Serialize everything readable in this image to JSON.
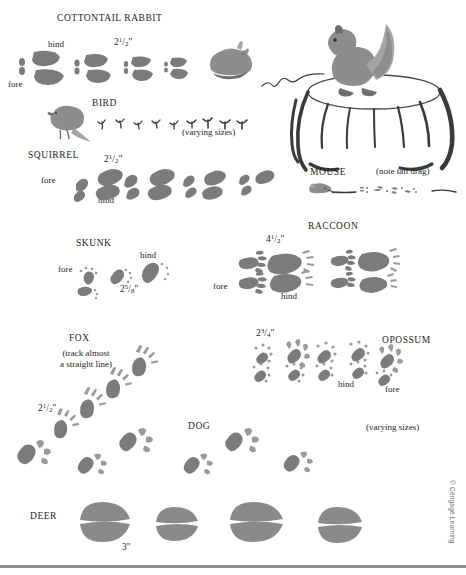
{
  "chart": {
    "credit": "© Cengage Learning"
  },
  "species": [
    {
      "id": "cottontail-rabbit",
      "name": "COTTONTAIL RABBIT",
      "measurement": {
        "whole": "2",
        "num": "1",
        "den": "2",
        "unit": "\""
      },
      "notes": [
        {
          "text": "hind"
        },
        {
          "text": "fore"
        }
      ]
    },
    {
      "id": "bird",
      "name": "BIRD",
      "notes": [
        {
          "text": "(varying sizes)"
        }
      ]
    },
    {
      "id": "squirrel",
      "name": "SQUIRREL",
      "measurement": {
        "whole": "2",
        "num": "1",
        "den": "2",
        "unit": "\""
      },
      "notes": [
        {
          "text": "fore"
        },
        {
          "text": "hind"
        }
      ]
    },
    {
      "id": "mouse",
      "name": "MOUSE",
      "notes": [
        {
          "text": "(note tail drag)"
        }
      ]
    },
    {
      "id": "skunk",
      "name": "SKUNK",
      "measurement": {
        "whole": "2",
        "num": "5",
        "den": "8",
        "unit": "\""
      },
      "notes": [
        {
          "text": "fore"
        },
        {
          "text": "hind"
        }
      ]
    },
    {
      "id": "raccoon",
      "name": "RACCOON",
      "measurement": {
        "whole": "4",
        "num": "1",
        "den": "2",
        "unit": "\""
      },
      "notes": [
        {
          "text": "fore"
        },
        {
          "text": "hind"
        }
      ]
    },
    {
      "id": "fox",
      "name": "FOX",
      "measurement": {
        "whole": "2",
        "num": "1",
        "den": "2",
        "unit": "\""
      },
      "notes": [
        {
          "text": "(track almost\na straight line)"
        }
      ]
    },
    {
      "id": "opossum",
      "name": "OPOSSUM",
      "measurement": {
        "whole": "2",
        "num": "3",
        "den": "4",
        "unit": "\""
      },
      "notes": [
        {
          "text": "hind"
        },
        {
          "text": "fore"
        }
      ]
    },
    {
      "id": "dog",
      "name": "DOG",
      "notes": [
        {
          "text": "(varying sizes)"
        }
      ]
    },
    {
      "id": "deer",
      "name": "DEER",
      "measurement": {
        "whole": "3",
        "num": "",
        "den": "",
        "unit": "\""
      }
    }
  ],
  "labels": {
    "rabbit_name": "COTTONTAIL RABBIT",
    "rabbit_hind": "hind",
    "rabbit_fore": "fore",
    "rabbit_meas_whole": "2",
    "rabbit_meas_num": "1",
    "rabbit_meas_den": "2",
    "bird_name": "BIRD",
    "bird_note": "(varying sizes)",
    "squirrel_name": "SQUIRREL",
    "squirrel_fore": "fore",
    "squirrel_hind": "hind",
    "squirrel_meas_whole": "2",
    "squirrel_meas_num": "1",
    "squirrel_meas_den": "2",
    "mouse_name": "MOUSE",
    "mouse_note": "(note tail drag)",
    "skunk_name": "SKUNK",
    "skunk_fore": "fore",
    "skunk_hind": "hind",
    "skunk_meas_whole": "2",
    "skunk_meas_num": "5",
    "skunk_meas_den": "8",
    "raccoon_name": "RACCOON",
    "raccoon_fore": "fore",
    "raccoon_hind": "hind",
    "raccoon_meas_whole": "4",
    "raccoon_meas_num": "1",
    "raccoon_meas_den": "2",
    "fox_name": "FOX",
    "fox_note": "(track almost a straight line)",
    "fox_note_line1": "(track almost",
    "fox_note_line2": "a straight line)",
    "fox_meas_whole": "2",
    "fox_meas_num": "1",
    "fox_meas_den": "2",
    "opossum_name": "OPOSSUM",
    "opossum_hind": "hind",
    "opossum_fore": "fore",
    "opossum_meas_whole": "2",
    "opossum_meas_num": "3",
    "opossum_meas_den": "4",
    "dog_name": "DOG",
    "dog_note": "(varying sizes)",
    "deer_name": "DEER",
    "deer_meas": "3\"",
    "inch_mark": "\"",
    "credit": "© Cengage Learning"
  },
  "colors": {
    "track_gray": "#7b7b7b",
    "illustration_gray": "#8d8d8d",
    "ink": "#231f20",
    "rule": "#8d8d8d",
    "page": "#ffffff"
  }
}
